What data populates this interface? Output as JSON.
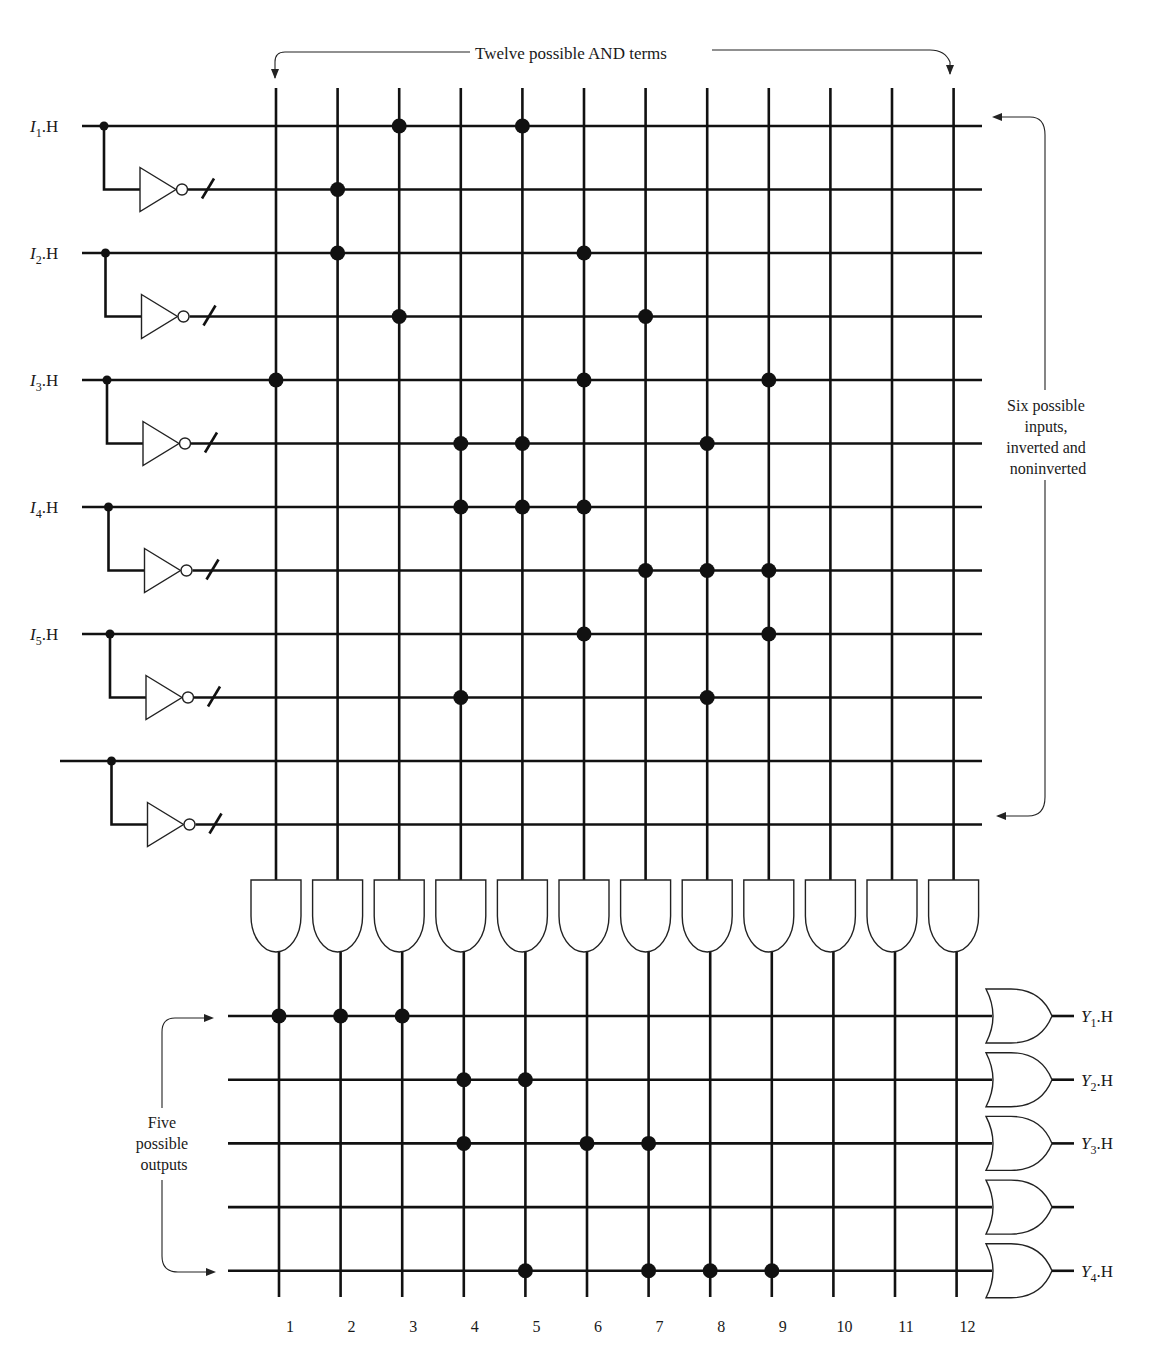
{
  "annotations": {
    "top": "Twelve possible AND terms",
    "right": [
      "Six possible",
      "inputs,",
      "inverted and",
      "noninverted"
    ],
    "left": [
      "Five",
      "possible",
      "outputs"
    ]
  },
  "inputs": [
    {
      "label_main": "I",
      "label_sub": "1",
      "label_suffix": ".H"
    },
    {
      "label_main": "I",
      "label_sub": "2",
      "label_suffix": ".H"
    },
    {
      "label_main": "I",
      "label_sub": "3",
      "label_suffix": ".H"
    },
    {
      "label_main": "I",
      "label_sub": "4",
      "label_suffix": ".H"
    },
    {
      "label_main": "I",
      "label_sub": "5",
      "label_suffix": ".H"
    },
    {
      "label_main": "",
      "label_sub": "",
      "label_suffix": ""
    }
  ],
  "and_term_numbers": [
    "1",
    "2",
    "3",
    "4",
    "5",
    "6",
    "7",
    "8",
    "9",
    "10",
    "11",
    "12"
  ],
  "and_connections": [
    [
      3,
      5
    ],
    [
      2
    ],
    [
      2,
      6
    ],
    [
      3,
      7
    ],
    [
      1,
      6,
      9
    ],
    [
      4,
      5,
      8
    ],
    [
      4,
      5,
      6
    ],
    [
      7,
      8,
      9
    ],
    [
      6,
      9
    ],
    [
      4,
      8
    ],
    [],
    []
  ],
  "outputs": [
    {
      "label_main": "Y",
      "label_sub": "1",
      "label_suffix": ".H",
      "terms": [
        1,
        2,
        3
      ]
    },
    {
      "label_main": "Y",
      "label_sub": "2",
      "label_suffix": ".H",
      "terms": [
        4,
        5
      ]
    },
    {
      "label_main": "Y",
      "label_sub": "3",
      "label_suffix": ".H",
      "terms": [
        4,
        6,
        7
      ]
    },
    {
      "label_main": "",
      "label_sub": "",
      "label_suffix": "",
      "terms": []
    },
    {
      "label_main": "Y",
      "label_sub": "4",
      "label_suffix": ".H",
      "terms": [
        5,
        7,
        8,
        9
      ]
    }
  ],
  "colors": {
    "ink": "#111111",
    "paper": "#ffffff"
  }
}
